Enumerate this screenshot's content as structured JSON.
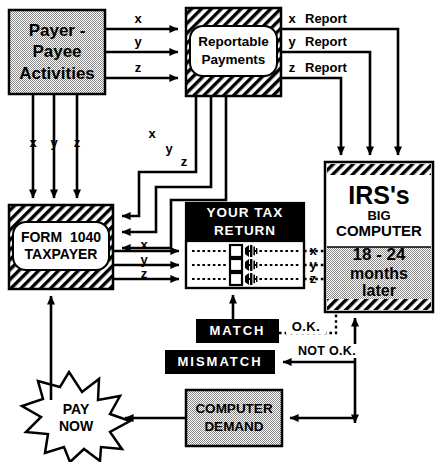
{
  "diagram": {
    "nodes": {
      "payer_payee": {
        "name": "payer-payee-activities",
        "lines": [
          "Payer -",
          "Payee",
          "Activities"
        ],
        "text": "Payer - Payee Activities",
        "fill": "#c8c8c8",
        "style": "gray-box"
      },
      "reportable": {
        "name": "reportable-payments",
        "lines": [
          "Reportable",
          "Payments"
        ],
        "text": "Reportable Payments",
        "fill": "#ffffff",
        "style": "hatched-box"
      },
      "form1040": {
        "name": "form-1040-taxpayer",
        "lines": [
          "FORM  1040",
          "TAXPAYER"
        ],
        "text": "FORM 1040 TAXPAYER",
        "fill": "#ffffff",
        "style": "hatched-box"
      },
      "taxreturn": {
        "name": "your-tax-return",
        "header_lines": [
          "YOUR TAX",
          "RETURN"
        ],
        "header": "YOUR TAX RETURN",
        "fill": "#000000",
        "style": "black-header-box"
      },
      "irs": {
        "name": "irs-big-computer",
        "top_lines": [
          "IRS's",
          "BIG",
          "COMPUTER"
        ],
        "bottom_lines": [
          "18 - 24",
          "months",
          "later"
        ],
        "top": "IRS's BIG COMPUTER",
        "bottom": "18 - 24 months later",
        "fill": "#c8c8c8",
        "style": "hatched-edge-box"
      },
      "match": {
        "name": "match-box",
        "text": "MATCH",
        "fill": "#000000",
        "color": "#ffffff"
      },
      "mismatch": {
        "name": "mismatch-box",
        "text": "MISMATCH",
        "fill": "#000000",
        "color": "#ffffff"
      },
      "computer_demand": {
        "name": "computer-demand",
        "lines": [
          "COMPUTER",
          "DEMAND"
        ],
        "text": "COMPUTER DEMAND",
        "fill": "#c8c8c8"
      },
      "pay_now": {
        "name": "pay-now-burst",
        "lines": [
          "PAY",
          "NOW"
        ],
        "text": "PAY NOW",
        "fill": "#ffffff"
      }
    },
    "edge_labels": {
      "payer_to_reportable": [
        "x",
        "y",
        "z"
      ],
      "payer_down": [
        "x",
        "y",
        "z"
      ],
      "reports_to_irs": [
        "x  Report",
        "y  Report",
        "z  Report"
      ],
      "reports_x": "x",
      "reports_y": "y",
      "reports_z": "z",
      "report_word": "Report",
      "reportable_to_form": [
        "x",
        "y",
        "z"
      ],
      "form_to_return": [
        "x",
        "y",
        "z"
      ],
      "return_to_irs": [
        "x",
        "y",
        "z"
      ],
      "ok": "O.K.",
      "not_ok": "NOT  O.K."
    },
    "colors": {
      "ink": "#000000",
      "gray_fill": "#c8c8c8",
      "white": "#ffffff"
    }
  }
}
